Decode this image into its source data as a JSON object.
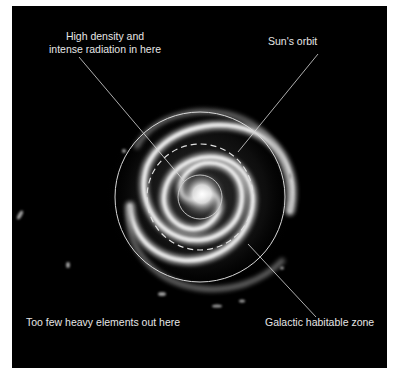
{
  "diagram": {
    "title": "Galactic habitable zone",
    "background_color": "#000000",
    "line_color": "#d9d9d9",
    "labels": {
      "core_line1": "High density and",
      "core_line2": "intense radiation in here",
      "sun_orbit": "Sun's orbit",
      "outer": "Too few heavy elements out here",
      "habitable_zone": "Galactic habitable zone"
    },
    "regions": [
      {
        "name": "galactic-core",
        "style": "solid",
        "radius_px": 22
      },
      {
        "name": "suns-orbit",
        "style": "dashed",
        "radius_px": 53
      },
      {
        "name": "habitable-zone-outer-boundary",
        "style": "solid",
        "radius_px": 85
      }
    ]
  }
}
